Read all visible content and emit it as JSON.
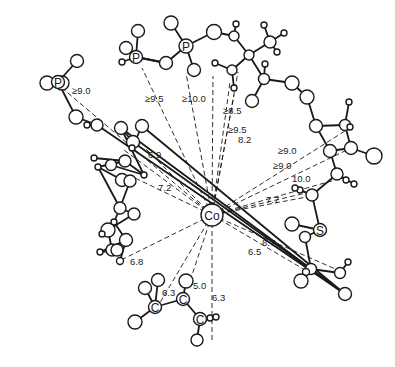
{
  "figure": {
    "center_atom": "Co",
    "element_labels": [
      "P",
      "P",
      "P",
      "S",
      "C",
      "C",
      "C"
    ],
    "distances": [
      {
        "to": "P (left)",
        "label": "≥9.0"
      },
      {
        "to": "P (top-left)",
        "label": "≥9.5"
      },
      {
        "to": "P (top)",
        "label": "≥10.0"
      },
      {
        "to": "top methyl",
        "label": "≥8.5"
      },
      {
        "to": "top chain",
        "label": "≥9.5"
      },
      {
        "to": "top chain atom",
        "label": "8.2"
      },
      {
        "to": "right ring",
        "label": "≥9.0"
      },
      {
        "to": "right ring lower",
        "label": "≥9.0"
      },
      {
        "to": "right methyl",
        "label": "10.0"
      },
      {
        "to": "S-chain",
        "label": "7.7"
      },
      {
        "to": "lower right",
        "label": "8.7"
      },
      {
        "to": "lower right 2",
        "label": "6.5"
      },
      {
        "to": "bottom C",
        "label": "6.3"
      },
      {
        "to": "bottom C left",
        "label": "6.3"
      },
      {
        "to": "bottom C mid",
        "label": "5.0"
      },
      {
        "to": "left ring stack",
        "label": "6.8"
      },
      {
        "to": "left ring",
        "label": "7.2"
      },
      {
        "to": "left ring upper",
        "label": "6.9"
      }
    ]
  }
}
